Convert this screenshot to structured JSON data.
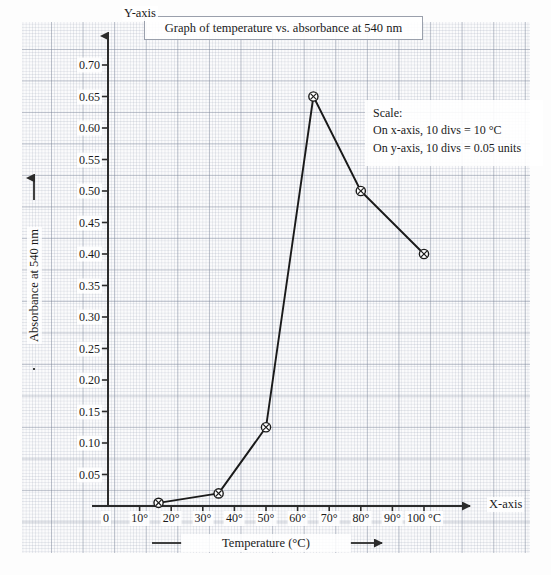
{
  "title": "Graph of temperature vs. absorbance at 540 nm",
  "axis_names": {
    "y": "Y-axis",
    "x": "X-axis"
  },
  "captions": {
    "y": "Absorbance at 540 nm",
    "x": "Temperature (°C)"
  },
  "scale_note": {
    "heading": "Scale:",
    "x_line": "On x-axis, 10 divs = 10 °C",
    "y_line": "On y-axis, 10 divs = 0.05 units"
  },
  "origin_label": "0",
  "colors": {
    "curve": "#1a1a1a",
    "axis": "#2b2b2b",
    "grid_major": "#8a93a6",
    "grid_minor": "#b9c0cd",
    "paper": "#fbfbfc",
    "box_border": "#9aa0ac"
  },
  "chart_data": {
    "type": "line",
    "title": "Graph of temperature vs. absorbance at 540 nm",
    "xlabel": "Temperature (°C)",
    "ylabel": "Absorbance at 540 nm",
    "xlim": [
      0,
      105
    ],
    "ylim": [
      0,
      0.7
    ],
    "grid": true,
    "legend": null,
    "markers": "circled-cross",
    "x": [
      16,
      35,
      50,
      65,
      80,
      100
    ],
    "y": [
      0.005,
      0.02,
      0.125,
      0.65,
      0.5,
      0.4
    ],
    "points": [
      {
        "x": 16,
        "y": 0.005
      },
      {
        "x": 35,
        "y": 0.02
      },
      {
        "x": 50,
        "y": 0.125
      },
      {
        "x": 65,
        "y": 0.65
      },
      {
        "x": 80,
        "y": 0.5
      },
      {
        "x": 100,
        "y": 0.4
      }
    ],
    "xticks": [
      {
        "value": 10,
        "label": "10°"
      },
      {
        "value": 20,
        "label": "20°"
      },
      {
        "value": 30,
        "label": "30°"
      },
      {
        "value": 40,
        "label": "40°"
      },
      {
        "value": 50,
        "label": "50°"
      },
      {
        "value": 60,
        "label": "60°"
      },
      {
        "value": 70,
        "label": "70°"
      },
      {
        "value": 80,
        "label": "80°"
      },
      {
        "value": 90,
        "label": "90°"
      },
      {
        "value": 100,
        "label": "100 °C"
      }
    ],
    "yticks": [
      {
        "value": 0.05,
        "label": "0.05"
      },
      {
        "value": 0.1,
        "label": "0.10"
      },
      {
        "value": 0.15,
        "label": "0.15"
      },
      {
        "value": 0.2,
        "label": "0.20"
      },
      {
        "value": 0.25,
        "label": "0.25"
      },
      {
        "value": 0.3,
        "label": "0.30"
      },
      {
        "value": 0.35,
        "label": "0.35"
      },
      {
        "value": 0.4,
        "label": "0.40"
      },
      {
        "value": 0.45,
        "label": "0.45"
      },
      {
        "value": 0.5,
        "label": "0.50"
      },
      {
        "value": 0.55,
        "label": "0.55"
      },
      {
        "value": 0.6,
        "label": "0.60"
      },
      {
        "value": 0.65,
        "label": "0.65"
      },
      {
        "value": 0.7,
        "label": "0.70"
      }
    ]
  }
}
